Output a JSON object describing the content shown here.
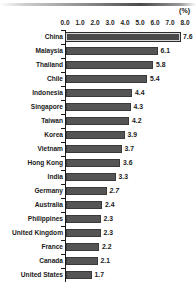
{
  "unit_label": "(%)",
  "chart_data": {
    "type": "bar",
    "orientation": "horizontal",
    "title": "",
    "subtitle": "",
    "xlabel": "(%)",
    "ylabel": "",
    "xlim": [
      0.0,
      8.0
    ],
    "xticks": [
      "0.0",
      "1.0",
      "2.0",
      "3.0",
      "4.0",
      "5.0",
      "6.0",
      "7.0",
      "8.0"
    ],
    "xtick_values": [
      0.0,
      1.0,
      2.0,
      3.0,
      4.0,
      5.0,
      6.0,
      7.0,
      8.0
    ],
    "grid": false,
    "legend": null,
    "categories": [
      "China",
      "Malaysia",
      "Thailand",
      "Chile",
      "Indonesia",
      "Singapore",
      "Taiwan",
      "Korea",
      "Vietnam",
      "Hong Kong",
      "India",
      "Germany",
      "Australia",
      "Philippines",
      "United Kingdom",
      "France",
      "Canada",
      "United States"
    ],
    "values": [
      7.6,
      6.1,
      5.8,
      5.4,
      4.4,
      4.3,
      4.2,
      3.9,
      3.7,
      3.6,
      3.3,
      2.7,
      2.4,
      2.3,
      2.3,
      2.2,
      2.1,
      1.7
    ],
    "value_labels": [
      "7.6",
      "6.1",
      "5.8",
      "5.4",
      "4.4",
      "4.3",
      "4.2",
      "3.9",
      "3.7",
      "3.6",
      "3.3",
      "2.7",
      "2.4",
      "2.3",
      "2.3",
      "2.2",
      "2.1",
      "1.7"
    ],
    "highlight_index": 0,
    "italic_value_indices": [
      11
    ],
    "colors": {
      "bar": "#555555",
      "bar_border": "#3a3a3a",
      "highlight_bar": "#4a4a4a",
      "highlight_border": "#d8d8d8",
      "axis": "#1a1a1a",
      "text": "#1a1a1a",
      "background": "#ffffff"
    }
  }
}
